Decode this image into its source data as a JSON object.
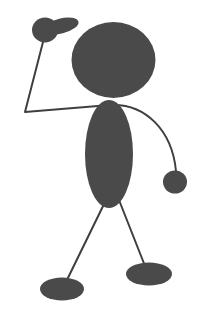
{
  "artwork": {
    "title": "Stick Figure Waving",
    "subject": "stick-figure-person",
    "canvas": {
      "width": 210,
      "height": 327
    },
    "colors": {
      "background": "#ffffff",
      "ink": "#4a4a4a",
      "stroke": "#3f3f3f"
    },
    "parts": {
      "head": {
        "name": "head",
        "shape": "ellipse",
        "cx": 113.5,
        "cy": 60,
        "rx": 42,
        "ry": 38
      },
      "torso": {
        "name": "torso",
        "shape": "ellipse",
        "cx": 109,
        "cy": 154,
        "rx": 24,
        "ry": 54
      },
      "left_hand_palm": {
        "name": "left-hand-palm",
        "shape": "ellipse",
        "cx": 45,
        "cy": 30,
        "rx": 13,
        "ry": 12.5
      },
      "left_hand_thumb": {
        "name": "left-hand-thumb",
        "shape": "ellipse",
        "cx": 61,
        "cy": 26,
        "rx": 18,
        "ry": 7.5,
        "rotate": -14
      },
      "right_hand": {
        "name": "right-hand",
        "shape": "ellipse",
        "cx": 175,
        "cy": 182,
        "rx": 12,
        "ry": 11.5
      },
      "left_foot": {
        "name": "left-foot",
        "shape": "ellipse",
        "cx": 62,
        "cy": 289,
        "rx": 22,
        "ry": 11.5
      },
      "right_foot": {
        "name": "right-foot",
        "shape": "ellipse",
        "cx": 149,
        "cy": 274,
        "rx": 23,
        "ry": 11.5
      },
      "left_arm": {
        "name": "left-arm",
        "shape": "polyline",
        "points": "43,42 25,112 110,105",
        "stroke_width": 2
      },
      "right_arm": {
        "name": "right-arm",
        "shape": "path",
        "d": "M 110 105 C 145 103 172 130 176 171",
        "stroke_width": 2
      },
      "left_leg": {
        "name": "left-leg",
        "shape": "line",
        "x1": 106,
        "y1": 200,
        "x2": 64,
        "y2": 286,
        "stroke_width": 2
      },
      "right_leg": {
        "name": "right-leg",
        "shape": "line",
        "x1": 119,
        "y1": 200,
        "x2": 145,
        "y2": 266,
        "stroke_width": 2
      }
    }
  }
}
